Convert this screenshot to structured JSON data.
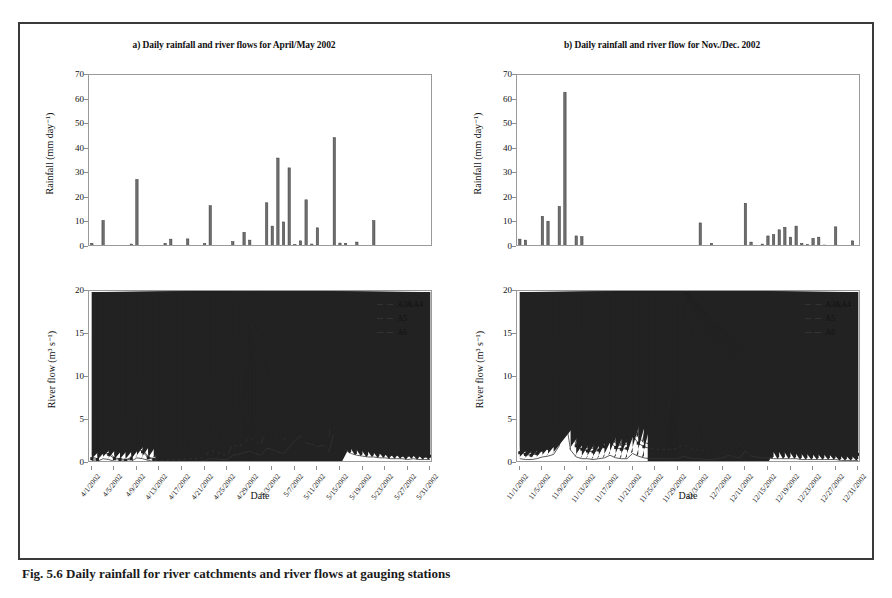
{
  "caption": "Fig. 5.6 Daily rainfall for river catchments and river flows at gauging stations",
  "panels": [
    {
      "id": "a",
      "title": "a) Daily rainfall and river flows for April/May 2002",
      "rain": {
        "ylabel": "Rainfall (mm day⁻¹)",
        "yticks": [
          0,
          10,
          20,
          30,
          40,
          50,
          60,
          70
        ]
      },
      "flow": {
        "ylabel": "River flow (m³ s⁻¹)",
        "yticks": [
          0,
          5,
          10,
          15,
          20
        ]
      },
      "xlabel": "Date",
      "xticklabels": [
        "4/1/2002",
        "4/5/2002",
        "4/9/2002",
        "4/13/2002",
        "4/17/2002",
        "4/21/2002",
        "4/25/2002",
        "4/29/2002",
        "5/3/2002",
        "5/7/2002",
        "5/11/2002",
        "5/15/2002",
        "5/19/2002",
        "5/23/2002",
        "5/27/2002",
        "5/31/2002"
      ],
      "legend": [
        {
          "label": "A3&A4",
          "marker": "diamond"
        },
        {
          "label": "A5",
          "marker": "square"
        },
        {
          "label": "A6",
          "marker": "triangle"
        }
      ]
    },
    {
      "id": "b",
      "title": "b) Daily rainfall and river flow for Nov./Dec. 2002",
      "rain": {
        "ylabel": "Rainfall (mm day⁻¹)",
        "yticks": [
          0,
          10,
          20,
          30,
          40,
          50,
          60,
          70
        ]
      },
      "flow": {
        "ylabel": "River flow (m³ s⁻¹)",
        "yticks": [
          0,
          5,
          10,
          15,
          20
        ]
      },
      "xlabel": "Date",
      "xticklabels": [
        "11/1/2002",
        "11/5/2002",
        "11/9/2002",
        "11/13/2002",
        "11/17/2002",
        "11/21/2002",
        "11/25/2002",
        "11/29/2002",
        "12/3/2002",
        "12/7/2002",
        "12/11/2002",
        "12/15/2002",
        "12/19/2002",
        "12/23/2002",
        "12/27/2002",
        "12/31/2002"
      ],
      "legend": [
        {
          "label": "A3&A4",
          "marker": "diamond"
        },
        {
          "label": "A5",
          "marker": "square"
        },
        {
          "label": "A6",
          "marker": "triangle"
        }
      ]
    }
  ],
  "chart_data": [
    {
      "type": "bar",
      "panel": "a",
      "subplot": "rainfall",
      "title": "a) Daily rainfall and river flows for April/May 2002",
      "xlabel": "Date",
      "ylabel": "Rainfall (mm day⁻¹)",
      "ylim": [
        0,
        70
      ],
      "grid": false,
      "x": [
        "4/1/2002",
        "4/2/2002",
        "4/3/2002",
        "4/4/2002",
        "4/5/2002",
        "4/6/2002",
        "4/7/2002",
        "4/8/2002",
        "4/9/2002",
        "4/10/2002",
        "4/11/2002",
        "4/12/2002",
        "4/13/2002",
        "4/14/2002",
        "4/15/2002",
        "4/16/2002",
        "4/17/2002",
        "4/18/2002",
        "4/19/2002",
        "4/20/2002",
        "4/21/2002",
        "4/22/2002",
        "4/23/2002",
        "4/24/2002",
        "4/25/2002",
        "4/26/2002",
        "4/27/2002",
        "4/28/2002",
        "4/29/2002",
        "4/30/2002",
        "5/1/2002",
        "5/2/2002",
        "5/3/2002",
        "5/4/2002",
        "5/5/2002",
        "5/6/2002",
        "5/7/2002",
        "5/8/2002",
        "5/9/2002",
        "5/10/2002",
        "5/11/2002",
        "5/12/2002",
        "5/13/2002",
        "5/14/2002",
        "5/15/2002",
        "5/16/2002",
        "5/17/2002",
        "5/18/2002",
        "5/19/2002",
        "5/20/2002",
        "5/21/2002",
        "5/22/2002",
        "5/23/2002",
        "5/24/2002",
        "5/25/2002",
        "5/26/2002",
        "5/27/2002",
        "5/28/2002",
        "5/29/2002",
        "5/30/2002",
        "5/31/2002"
      ],
      "values": [
        1.5,
        0,
        10.8,
        0,
        0,
        0,
        0,
        1.2,
        27.5,
        0,
        0,
        0,
        0,
        1.5,
        3.2,
        0,
        0,
        3.3,
        0,
        0,
        1.4,
        16.8,
        0,
        0,
        0,
        2.2,
        0,
        6.0,
        2.8,
        0,
        0,
        18.0,
        8.5,
        36.2,
        10.2,
        32.2,
        1.0,
        2.5,
        19.2,
        1.2,
        7.8,
        0.4,
        0,
        44.5,
        1.6,
        1.5,
        0,
        2.0,
        0,
        0,
        10.7,
        0,
        0,
        0,
        0,
        0,
        0,
        0,
        0,
        0,
        0
      ]
    },
    {
      "type": "line",
      "panel": "a",
      "subplot": "river_flow",
      "xlabel": "Date",
      "ylabel": "River flow (m³ s⁻¹)",
      "ylim": [
        0,
        20
      ],
      "grid": false,
      "legend_position": "top-right",
      "x": [
        "4/1/2002",
        "4/2/2002",
        "4/3/2002",
        "4/4/2002",
        "4/5/2002",
        "4/6/2002",
        "4/7/2002",
        "4/8/2002",
        "4/9/2002",
        "4/10/2002",
        "4/11/2002",
        "4/12/2002",
        "4/13/2002",
        "4/14/2002",
        "4/15/2002",
        "4/16/2002",
        "4/17/2002",
        "4/18/2002",
        "4/19/2002",
        "4/20/2002",
        "4/21/2002",
        "4/22/2002",
        "4/23/2002",
        "4/24/2002",
        "4/25/2002",
        "4/26/2002",
        "4/27/2002",
        "4/28/2002",
        "4/29/2002",
        "4/30/2002",
        "5/1/2002",
        "5/2/2002",
        "5/3/2002",
        "5/4/2002",
        "5/5/2002",
        "5/6/2002",
        "5/7/2002",
        "5/8/2002",
        "5/9/2002",
        "5/10/2002",
        "5/11/2002",
        "5/12/2002",
        "5/13/2002",
        "5/14/2002",
        "5/15/2002",
        "5/16/2002",
        "5/17/2002",
        "5/18/2002",
        "5/19/2002",
        "5/20/2002",
        "5/21/2002",
        "5/22/2002",
        "5/23/2002",
        "5/24/2002",
        "5/25/2002",
        "5/26/2002",
        "5/27/2002",
        "5/28/2002",
        "5/29/2002",
        "5/30/2002",
        "5/31/2002"
      ],
      "series": [
        {
          "name": "A3&A4",
          "marker": "diamond",
          "values": [
            0.7,
            0.5,
            1.5,
            1.3,
            0.6,
            0.5,
            0.4,
            0.6,
            2.1,
            1.6,
            0.7,
            0.5,
            0.4,
            0.4,
            0.5,
            0.5,
            0.5,
            0.6,
            0.6,
            0.6,
            0.8,
            1.7,
            1.5,
            1.2,
            1.1,
            2.5,
            2.2,
            2.7,
            3.5,
            3.0,
            2.4,
            7.0,
            4.1,
            3.4,
            2.9,
            5.0,
            6.6,
            11.8,
            8.2,
            8.0,
            6.2,
            6.0,
            3.3,
            12.3,
            6.9,
            4.0,
            2.8,
            2.2,
            1.8,
            1.7,
            1.5,
            1.4,
            1.3,
            1.2,
            1.1,
            1.0,
            1.0,
            1.1,
            1.0,
            0.9,
            0.9
          ]
        },
        {
          "name": "A5",
          "marker": "square",
          "values": [
            0.5,
            0.4,
            1.2,
            1.0,
            0.5,
            0.4,
            0.3,
            0.5,
            1.8,
            1.3,
            0.6,
            0.4,
            0.3,
            0.3,
            0.4,
            0.4,
            0.4,
            0.5,
            0.5,
            0.5,
            0.7,
            1.5,
            1.3,
            1.0,
            0.9,
            2.1,
            1.9,
            2.3,
            3.0,
            2.6,
            2.1,
            4.3,
            3.5,
            2.9,
            2.5,
            4.2,
            5.5,
            8.3,
            7.0,
            6.8,
            5.2,
            5.0,
            2.8,
            10.5,
            5.9,
            3.4,
            2.4,
            1.9,
            1.6,
            1.5,
            1.3,
            1.2,
            1.1,
            1.0,
            1.0,
            0.9,
            0.9,
            1.0,
            0.9,
            0.8,
            0.8
          ]
        },
        {
          "name": "A6",
          "marker": "triangle",
          "values": [
            0.3,
            0.2,
            0.5,
            0.4,
            0.2,
            0.2,
            0.2,
            0.2,
            0.6,
            0.5,
            0.3,
            0.2,
            0.2,
            0.2,
            0.2,
            0.2,
            0.2,
            0.2,
            0.2,
            0.2,
            0.3,
            0.5,
            0.5,
            0.4,
            0.4,
            0.9,
            1.0,
            1.2,
            1.4,
            1.1,
            0.9,
            1.7,
            1.6,
            1.3,
            1.1,
            1.8,
            2.6,
            3.2,
            2.3,
            2.2,
            1.9,
            2.1,
            1.3,
            3.6,
            2.4,
            1.5,
            1.1,
            0.9,
            0.8,
            0.7,
            0.7,
            0.6,
            0.6,
            0.5,
            0.5,
            0.5,
            0.4,
            0.5,
            0.4,
            0.4,
            0.4
          ]
        }
      ]
    },
    {
      "type": "bar",
      "panel": "b",
      "subplot": "rainfall",
      "title": "b) Daily rainfall and river flow for Nov./Dec. 2002",
      "xlabel": "Date",
      "ylabel": "Rainfall (mm day⁻¹)",
      "ylim": [
        0,
        70
      ],
      "grid": false,
      "x": [
        "11/1/2002",
        "11/2/2002",
        "11/3/2002",
        "11/4/2002",
        "11/5/2002",
        "11/6/2002",
        "11/7/2002",
        "11/8/2002",
        "11/9/2002",
        "11/10/2002",
        "11/11/2002",
        "11/12/2002",
        "11/13/2002",
        "11/14/2002",
        "11/15/2002",
        "11/16/2002",
        "11/17/2002",
        "11/18/2002",
        "11/19/2002",
        "11/20/2002",
        "11/21/2002",
        "11/22/2002",
        "11/23/2002",
        "11/24/2002",
        "11/25/2002",
        "11/26/2002",
        "11/27/2002",
        "11/28/2002",
        "11/29/2002",
        "11/30/2002",
        "12/1/2002",
        "12/2/2002",
        "12/3/2002",
        "12/4/2002",
        "12/5/2002",
        "12/6/2002",
        "12/7/2002",
        "12/8/2002",
        "12/9/2002",
        "12/10/2002",
        "12/11/2002",
        "12/12/2002",
        "12/13/2002",
        "12/14/2002",
        "12/15/2002",
        "12/16/2002",
        "12/17/2002",
        "12/18/2002",
        "12/19/2002",
        "12/20/2002",
        "12/21/2002",
        "12/22/2002",
        "12/23/2002",
        "12/24/2002",
        "12/25/2002",
        "12/26/2002",
        "12/27/2002",
        "12/28/2002",
        "12/29/2002",
        "12/30/2002",
        "12/31/2002"
      ],
      "values": [
        3.2,
        2.8,
        0,
        0,
        12.5,
        10.5,
        0,
        16.5,
        63.0,
        0,
        4.5,
        4.2,
        0,
        0,
        0,
        0,
        0,
        0.5,
        0.4,
        0,
        0,
        0,
        0,
        0,
        0,
        0,
        0,
        0,
        0,
        0,
        0,
        0,
        9.8,
        0,
        1.5,
        0,
        0,
        0,
        0,
        0,
        17.8,
        2.0,
        0,
        1.2,
        4.5,
        5.0,
        7.0,
        8.0,
        4.0,
        8.5,
        1.5,
        1.0,
        3.5,
        4.0,
        0.8,
        0,
        8.2,
        0,
        0,
        2.5,
        0.5
      ]
    },
    {
      "type": "line",
      "panel": "b",
      "subplot": "river_flow",
      "xlabel": "Date",
      "ylabel": "River flow (m³ s⁻¹)",
      "ylim": [
        0,
        20
      ],
      "grid": false,
      "legend_position": "top-right",
      "x": [
        "11/1/2002",
        "11/2/2002",
        "11/3/2002",
        "11/4/2002",
        "11/5/2002",
        "11/6/2002",
        "11/7/2002",
        "11/8/2002",
        "11/9/2002",
        "11/10/2002",
        "11/11/2002",
        "11/12/2002",
        "11/13/2002",
        "11/14/2002",
        "11/15/2002",
        "11/16/2002",
        "11/17/2002",
        "11/18/2002",
        "11/19/2002",
        "11/20/2002",
        "11/21/2002",
        "11/22/2002",
        "11/23/2002",
        "11/24/2002",
        "11/25/2002",
        "11/26/2002",
        "11/27/2002",
        "11/28/2002",
        "11/29/2002",
        "11/30/2002",
        "12/1/2002",
        "12/2/2002",
        "12/3/2002",
        "12/4/2002",
        "12/5/2002",
        "12/6/2002",
        "12/7/2002",
        "12/8/2002",
        "12/9/2002",
        "12/10/2002",
        "12/11/2002",
        "12/12/2002",
        "12/13/2002",
        "12/14/2002",
        "12/15/2002",
        "12/16/2002",
        "12/17/2002",
        "12/18/2002",
        "12/19/2002",
        "12/20/2002",
        "12/21/2002",
        "12/22/2002",
        "12/23/2002",
        "12/24/2002",
        "12/25/2002",
        "12/26/2002",
        "12/27/2002",
        "12/28/2002",
        "12/29/2002",
        "12/30/2002",
        "12/31/2002"
      ],
      "series": [
        {
          "name": "A3&A4",
          "marker": "diamond",
          "values": [
            1.6,
            1.3,
            1.2,
            1.5,
            2.0,
            2.2,
            2.6,
            5.2,
            15.5,
            6.0,
            2.6,
            2.0,
            1.8,
            1.7,
            2.0,
            2.4,
            3.2,
            2.3,
            2.0,
            2.2,
            4.1,
            3.0,
            2.4,
            2.2,
            2.1,
            2.0,
            2.1,
            2.0,
            2.2,
            2.9,
            2.3,
            2.0,
            1.9,
            1.8,
            1.8,
            1.9,
            2.4,
            3.2,
            2.6,
            2.4,
            4.8,
            3.0,
            2.6,
            2.3,
            2.2,
            2.1,
            2.0,
            2.0,
            2.0,
            1.9,
            1.8,
            1.7,
            1.7,
            1.6,
            1.5,
            1.5,
            1.5,
            1.4,
            1.3,
            1.2,
            1.2
          ]
        },
        {
          "name": "A5",
          "marker": "square",
          "values": [
            1.2,
            1.0,
            0.9,
            1.1,
            1.5,
            1.7,
            2.0,
            4.0,
            11.5,
            4.6,
            2.0,
            1.6,
            1.4,
            1.3,
            1.5,
            1.9,
            2.5,
            1.8,
            1.6,
            1.7,
            3.2,
            2.3,
            1.9,
            1.7,
            1.6,
            1.6,
            1.6,
            1.6,
            1.7,
            2.2,
            1.8,
            1.6,
            1.5,
            1.4,
            1.4,
            1.5,
            1.9,
            2.5,
            2.0,
            1.9,
            3.7,
            2.3,
            2.0,
            1.8,
            1.7,
            1.6,
            1.6,
            1.6,
            1.5,
            1.5,
            1.4,
            1.3,
            1.3,
            1.2,
            1.2,
            1.2,
            1.1,
            1.1,
            1.0,
            1.0,
            1.0
          ]
        },
        {
          "name": "A6",
          "marker": "triangle",
          "values": [
            0.5,
            0.4,
            0.4,
            0.5,
            0.7,
            0.8,
            1.0,
            2.0,
            5.6,
            1.5,
            0.7,
            0.5,
            0.5,
            0.4,
            0.5,
            0.6,
            0.9,
            0.6,
            0.5,
            0.5,
            1.1,
            0.8,
            0.6,
            0.5,
            0.5,
            0.5,
            0.5,
            0.5,
            0.5,
            0.8,
            0.6,
            0.5,
            0.5,
            0.4,
            0.4,
            0.5,
            0.6,
            0.9,
            0.7,
            0.6,
            1.4,
            0.8,
            0.7,
            0.6,
            0.6,
            0.5,
            0.5,
            0.5,
            0.5,
            0.5,
            0.4,
            0.4,
            0.4,
            0.4,
            0.4,
            0.4,
            0.4,
            0.3,
            0.3,
            0.3,
            0.3
          ]
        }
      ]
    }
  ]
}
